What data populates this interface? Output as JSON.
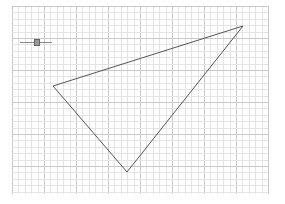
{
  "grid": {
    "origin_x": 12,
    "origin_y": 6,
    "width": 256,
    "height": 188,
    "minor_step": 6.4,
    "major_every": 5,
    "minor_color": "#e4e4e4",
    "major_color": "#c8c8c8"
  },
  "triangle": {
    "vertices": [
      [
        53,
        86
      ],
      [
        243,
        26
      ],
      [
        127,
        172
      ]
    ],
    "stroke": "#555555"
  },
  "slider": {
    "value": 0.5,
    "track_color": "#888888",
    "handle_color": "#999999"
  }
}
